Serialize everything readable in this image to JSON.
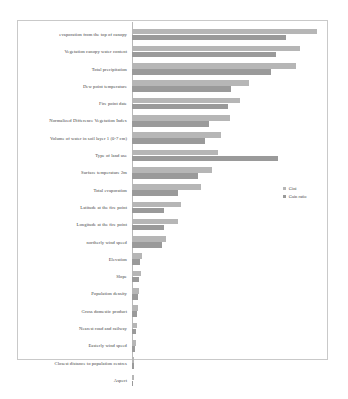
{
  "chart_data": {
    "type": "bar",
    "orientation": "horizontal",
    "title": "",
    "subtitle": "",
    "xlabel": "",
    "ylabel": "",
    "grid": false,
    "legend_position": "right",
    "xlim": [
      0,
      1.0
    ],
    "categories": [
      "evaporation from the top of canopy",
      "Vegetation canopy water content",
      "Total precipitation",
      "Dew point temperature",
      "Fire point date",
      "Normalized Difference Vegetation Index",
      "Volume of water in soil layer 1 (0-7 cm)",
      "Type of land use",
      "Surface temperature 2m",
      "Total evaporation",
      "Latitude at the fire point",
      "Longitude at the fire point",
      "northerly wind speed",
      "Elevation",
      "Slope",
      "Population density",
      "Gross domestic product",
      "Nearest road and railway",
      "Easterly wind speed",
      "Closest distance to population centres",
      "Aspect"
    ],
    "series": [
      {
        "name": "Gini",
        "color": "#b6b6b6",
        "values": [
          0.95,
          0.86,
          0.84,
          0.6,
          0.555,
          0.5,
          0.455,
          0.44,
          0.41,
          0.355,
          0.25,
          0.235,
          0.175,
          0.05,
          0.045,
          0.035,
          0.03,
          0.025,
          0.02,
          0.012,
          0.008
        ]
      },
      {
        "name": "Gain ratio",
        "color": "#9a9a9a",
        "values": [
          0.79,
          0.74,
          0.715,
          0.51,
          0.49,
          0.395,
          0.375,
          0.75,
          0.34,
          0.235,
          0.165,
          0.165,
          0.155,
          0.042,
          0.038,
          0.03,
          0.026,
          0.022,
          0.016,
          0.01,
          0.006
        ]
      }
    ]
  },
  "legend": {
    "items": [
      {
        "label": "Gini",
        "color": "#b6b6b6"
      },
      {
        "label": "Gain ratio",
        "color": "#9a9a9a"
      }
    ]
  }
}
